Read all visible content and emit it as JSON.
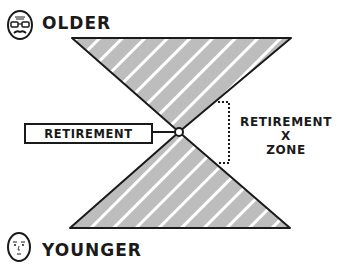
{
  "labels": {
    "top": "OLDER",
    "bottom": "YOUNGER",
    "pivot": "RETIREMENT",
    "zone_line1": "RETIREMENT",
    "zone_line2": "X",
    "zone_line3": "ZONE"
  },
  "icons": {
    "top_face": "elderly-face-with-glasses-icon",
    "bottom_face": "young-face-icon"
  },
  "colors": {
    "ink": "#1a1a1a",
    "fill": "#bdbdbd",
    "stripe": "#ffffff",
    "background": "#ffffff"
  }
}
